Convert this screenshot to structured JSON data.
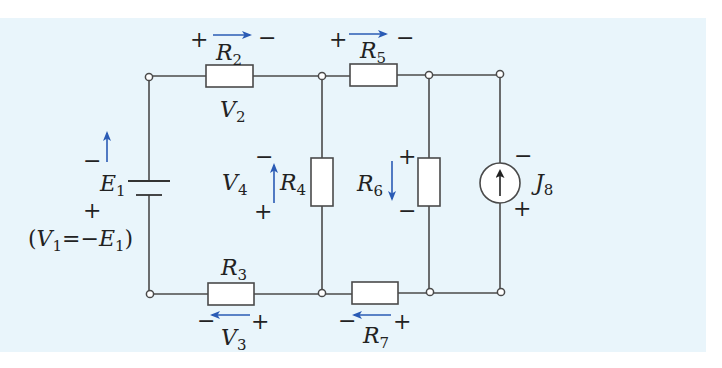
{
  "diagram": {
    "type": "electrical-circuit",
    "colors": {
      "background": "#e9f5fb",
      "wire": "#4a4a4a",
      "component_fill": "#ffffff",
      "arrow": "#2a5bb5",
      "text": "#222222"
    },
    "components": {
      "E1": {
        "symbol": "E",
        "sub": "1",
        "kind": "voltage-source",
        "top_sign": "−",
        "bottom_sign": "+",
        "note_open": "(",
        "note_v": "V",
        "note_v_sub": "1",
        "note_eq": "=−",
        "note_e": "E",
        "note_e_sub": "1",
        "note_close": ")"
      },
      "R2": {
        "symbol": "R",
        "sub": "2",
        "kind": "resistor",
        "left_sign": "+",
        "right_sign": "−",
        "voltage": "V",
        "voltage_sub": "2"
      },
      "R3": {
        "symbol": "R",
        "sub": "3",
        "kind": "resistor",
        "left_sign": "−",
        "right_sign": "+",
        "voltage": "V",
        "voltage_sub": "3"
      },
      "R4": {
        "symbol": "R",
        "sub": "4",
        "kind": "resistor",
        "top_sign": "−",
        "bottom_sign": "+",
        "voltage": "V",
        "voltage_sub": "4"
      },
      "R5": {
        "symbol": "R",
        "sub": "5",
        "kind": "resistor",
        "left_sign": "+",
        "right_sign": "−"
      },
      "R6": {
        "symbol": "R",
        "sub": "6",
        "kind": "resistor",
        "top_sign": "+",
        "bottom_sign": "−"
      },
      "R7": {
        "symbol": "R",
        "sub": "7",
        "kind": "resistor",
        "left_sign": "−",
        "right_sign": "+"
      },
      "J8": {
        "symbol": "J",
        "sub": "8",
        "kind": "current-source",
        "top_sign": "−",
        "bottom_sign": "+"
      }
    },
    "nodes": {
      "top": [
        149,
        322,
        429,
        500
      ],
      "bottom": [
        149,
        322,
        429,
        500
      ]
    }
  }
}
